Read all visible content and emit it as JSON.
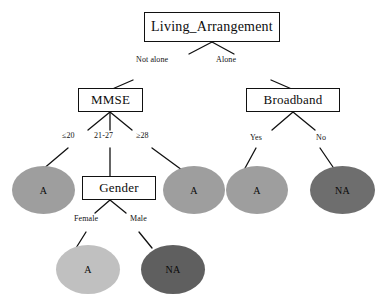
{
  "diagram": {
    "type": "decision-tree",
    "colors": {
      "node_border": "#111111",
      "node_fill": "#ffffff",
      "edge": "#111111",
      "leaf_a_medium": "#9e9e9e",
      "leaf_a_light": "#c0c0c0",
      "leaf_na_dark": "#6e6e6e",
      "leaf_na_darker": "#5f5f5f",
      "text": "#0d0d0d"
    }
  },
  "nodes": {
    "root": {
      "label": "Living_Arrangement"
    },
    "mmse": {
      "label": "MMSE"
    },
    "broadband": {
      "label": "Broadband"
    },
    "gender": {
      "label": "Gender"
    }
  },
  "leaves": {
    "mmse_low": {
      "label": "A"
    },
    "mmse_high": {
      "label": "A"
    },
    "broadband_yes": {
      "label": "A"
    },
    "broadband_no": {
      "label": "NA"
    },
    "gender_female": {
      "label": "A"
    },
    "gender_male": {
      "label": "NA"
    }
  },
  "edge_labels": {
    "not_alone": "Not alone",
    "alone": "Alone",
    "mmse_le20": "≤20",
    "mmse_21_27": "21-27",
    "mmse_ge28": "≥28",
    "broadband_yes": "Yes",
    "broadband_no": "No",
    "gender_female": "Female",
    "gender_male": "Male"
  }
}
